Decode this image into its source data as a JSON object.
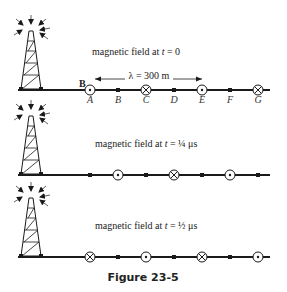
{
  "figure": {
    "title": "Figure 23-5",
    "field_symbol": "B",
    "wavelength_label": "λ = 300 m",
    "point_labels": [
      "A",
      "B",
      "C",
      "D",
      "E",
      "F",
      "G"
    ],
    "panels": [
      {
        "caption": "magnetic field at t = 0",
        "caption_prefix": "magnetic field at ",
        "caption_var": "t",
        "caption_eq": " = 0",
        "markers": [
          "out",
          "dot",
          "in",
          "dot",
          "out",
          "dot",
          "in"
        ]
      },
      {
        "caption": "magnetic field at t = ¼ μs",
        "caption_prefix": "magnetic field at ",
        "caption_var": "t",
        "caption_eq": " = ¼ μs",
        "markers": [
          "dot",
          "out",
          "dot",
          "in",
          "dot",
          "out",
          "dot"
        ]
      },
      {
        "caption": "magnetic field at t = ½ μs",
        "caption_prefix": "magnetic field at ",
        "caption_var": "t",
        "caption_eq": " = ½ μs",
        "markers": [
          "in",
          "dot",
          "out",
          "dot",
          "in",
          "dot",
          "out"
        ]
      }
    ],
    "colors": {
      "ink": "#1a1a1a",
      "background": "#ffffff"
    }
  }
}
